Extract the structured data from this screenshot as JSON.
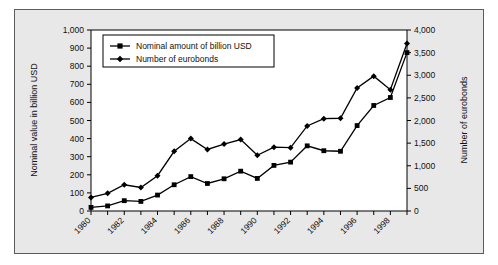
{
  "chart_data": {
    "type": "line",
    "title": "",
    "xlabel": "",
    "x": [
      1980,
      1981,
      1982,
      1983,
      1984,
      1985,
      1986,
      1987,
      1988,
      1989,
      1990,
      1991,
      1992,
      1993,
      1994,
      1995,
      1996,
      1997,
      1998,
      1999
    ],
    "x_tick_labels": [
      "1980",
      "1982",
      "1984",
      "1986",
      "1988",
      "1990",
      "1992",
      "1994",
      "1996",
      "1998"
    ],
    "x_tick_values": [
      1980,
      1982,
      1984,
      1986,
      1988,
      1990,
      1992,
      1994,
      1996,
      1998
    ],
    "xlim": [
      1980,
      1999
    ],
    "grid": false,
    "legend_position": "upper-left-inside",
    "axes": {
      "left": {
        "label": "Nominal value in billion USD",
        "min": 0,
        "max": 1000,
        "step": 100,
        "tick_labels": [
          "0",
          "100",
          "200",
          "300",
          "400",
          "500",
          "600",
          "700",
          "800",
          "900",
          "1,000"
        ]
      },
      "right": {
        "label": "Number of eurobonds",
        "min": 0,
        "max": 4000,
        "step": 500,
        "tick_labels": [
          "0",
          "500",
          "1,000",
          "1,500",
          "2,000",
          "2,500",
          "3,000",
          "3,500",
          "4,000"
        ]
      }
    },
    "series": [
      {
        "name": "Nominal amount of billion USD",
        "axis": "left",
        "marker": "square",
        "color": "#000000",
        "values": [
          20,
          28,
          57,
          53,
          88,
          145,
          190,
          152,
          178,
          220,
          180,
          252,
          270,
          360,
          333,
          330,
          472,
          583,
          627,
          875
        ]
      },
      {
        "name": "Number of eurobonds",
        "axis": "right",
        "marker": "diamond",
        "color": "#000000",
        "values": [
          300,
          390,
          580,
          520,
          780,
          1320,
          1600,
          1360,
          1480,
          1580,
          1230,
          1410,
          1400,
          1880,
          2040,
          2050,
          2720,
          2980,
          2680,
          3700
        ]
      }
    ]
  },
  "legend": {
    "items": [
      {
        "label": "Nominal amount of billion USD",
        "marker": "square"
      },
      {
        "label": "Number of eurobonds",
        "marker": "diamond"
      }
    ]
  }
}
